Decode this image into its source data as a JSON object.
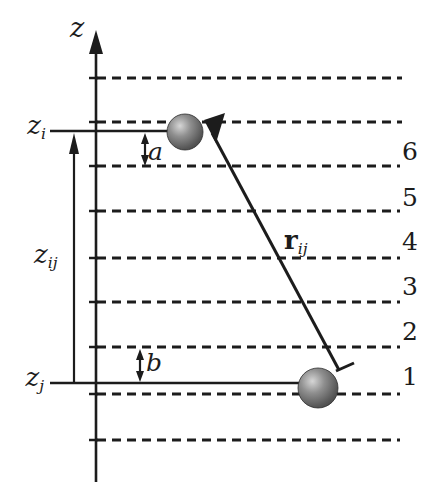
{
  "figure": {
    "title_hint": "two-particle slab geometry sketch",
    "axis_label": "z",
    "labels": {
      "z_i": {
        "base": "z",
        "sub": "i"
      },
      "z_ij": {
        "base": "z",
        "sub": "ij"
      },
      "z_j": {
        "base": "z",
        "sub": "j"
      },
      "a": "a",
      "b": "b",
      "r_ij": {
        "base": "r",
        "sub": "ij"
      }
    },
    "layer_numbers": [
      "6",
      "5",
      "4",
      "3",
      "2",
      "1"
    ],
    "colors": {
      "ink": "#1c1c1c",
      "background": "#ffffff",
      "sphere_highlight": "#d6d6d6",
      "sphere_mid": "#8f8f8f",
      "sphere_dark": "#3d3d3d"
    }
  }
}
